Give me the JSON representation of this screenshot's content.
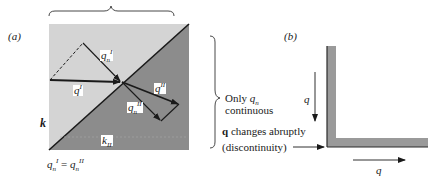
{
  "panel_a": {
    "label": "(a)",
    "medium_top_label": "k",
    "medium_bottom_label_base": "k",
    "medium_bottom_label_sub": "II",
    "vectors": {
      "incident": {
        "base": "q",
        "sup": "I"
      },
      "incident_normal": {
        "base": "q",
        "sub": "n",
        "sup": "I"
      },
      "refracted": {
        "base": "q",
        "sup": "II"
      },
      "refracted_normal": {
        "base": "q",
        "sub": "n",
        "sup": "II"
      }
    },
    "equation": {
      "lhs_base": "q",
      "lhs_sub": "n",
      "lhs_sup": "I",
      "eq": " = ",
      "rhs_base": "q",
      "rhs_sub": "n",
      "rhs_sup": "II"
    },
    "colors": {
      "region_light": "#d4d4d4",
      "region_dark": "#8c8c8c",
      "line": "#1a1a1a"
    }
  },
  "annotations": {
    "only_line1_prefix": "Only ",
    "only_line1_var": "q",
    "only_line1_sub": "n",
    "only_line2": "continuous",
    "changes_bold": "q",
    "changes_rest": " changes abruptly",
    "discontinuity": "(discontinuity)"
  },
  "panel_b": {
    "label": "(b)",
    "vertical_arrow_label": "q",
    "horizontal_arrow_label": "q",
    "colors": {
      "bar": "#9a9a9a",
      "edge": "#2a2a2a"
    }
  }
}
